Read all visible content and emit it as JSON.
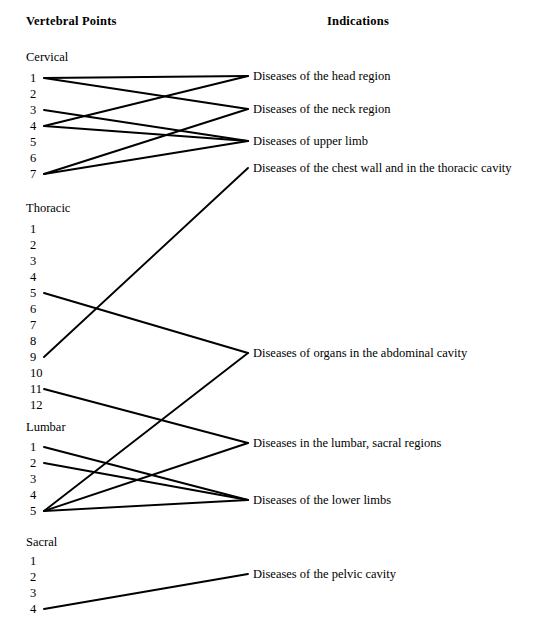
{
  "headers": {
    "left": "Vertebral Points",
    "right": "Indications"
  },
  "style": {
    "line_color": "#000000",
    "text_color": "#000000",
    "background": "#ffffff",
    "line_width": 1.9
  },
  "geometry": {
    "left_node_x": 44,
    "right_node_x": 248,
    "number_text_x": 30
  },
  "groups": [
    {
      "name": "Cervical",
      "label_y": 50,
      "first_number_y": 78,
      "number_spacing": 16,
      "numbers": [
        "1",
        "2",
        "3",
        "4",
        "5",
        "6",
        "7"
      ]
    },
    {
      "name": "Thoracic",
      "label_y": 201,
      "first_number_y": 229,
      "number_spacing": 16,
      "numbers": [
        "1",
        "2",
        "3",
        "4",
        "5",
        "6",
        "7",
        "8",
        "9",
        "10",
        "11",
        "12"
      ]
    },
    {
      "name": "Lumbar",
      "label_y": 420,
      "first_number_y": 447,
      "number_spacing": 16,
      "numbers": [
        "1",
        "2",
        "3",
        "4",
        "5"
      ]
    },
    {
      "name": "Sacral",
      "label_y": 535,
      "first_number_y": 561,
      "number_spacing": 16,
      "numbers": [
        "1",
        "2",
        "3",
        "4"
      ]
    }
  ],
  "indications": [
    {
      "id": "head",
      "label": "Diseases of the head region",
      "y": 76
    },
    {
      "id": "neck",
      "label": "Diseases of the neck region",
      "y": 109
    },
    {
      "id": "upper",
      "label": "Diseases of upper limb",
      "y": 141
    },
    {
      "id": "chest",
      "label": "Diseases of the chest wall and in the thoracic cavity",
      "y": 168
    },
    {
      "id": "abdomen",
      "label": "Diseases of organs in the abdominal cavity",
      "y": 353
    },
    {
      "id": "lumbosac",
      "label": "Diseases in the lumbar, sacral regions",
      "y": 443
    },
    {
      "id": "lower",
      "label": "Diseases of the lower limbs",
      "y": 500
    },
    {
      "id": "pelvic",
      "label": "Diseases of the pelvic cavity",
      "y": 574
    }
  ],
  "connections": [
    {
      "from_group": "Cervical",
      "from_number": "1",
      "to": "head"
    },
    {
      "from_group": "Cervical",
      "from_number": "1",
      "to": "neck"
    },
    {
      "from_group": "Cervical",
      "from_number": "3",
      "to": "upper"
    },
    {
      "from_group": "Cervical",
      "from_number": "4",
      "to": "head"
    },
    {
      "from_group": "Cervical",
      "from_number": "4",
      "to": "upper"
    },
    {
      "from_group": "Cervical",
      "from_number": "7",
      "to": "neck"
    },
    {
      "from_group": "Cervical",
      "from_number": "7",
      "to": "upper"
    },
    {
      "from_group": "Thoracic",
      "from_number": "9",
      "to": "chest"
    },
    {
      "from_group": "Thoracic",
      "from_number": "5",
      "to": "abdomen"
    },
    {
      "from_group": "Thoracic",
      "from_number": "11",
      "to": "lumbosac"
    },
    {
      "from_group": "Lumbar",
      "from_number": "1",
      "to": "lower"
    },
    {
      "from_group": "Lumbar",
      "from_number": "2",
      "to": "lower"
    },
    {
      "from_group": "Lumbar",
      "from_number": "5",
      "to": "abdomen"
    },
    {
      "from_group": "Lumbar",
      "from_number": "5",
      "to": "lumbosac"
    },
    {
      "from_group": "Lumbar",
      "from_number": "5",
      "to": "lower"
    },
    {
      "from_group": "Sacral",
      "from_number": "4",
      "to": "pelvic"
    }
  ]
}
